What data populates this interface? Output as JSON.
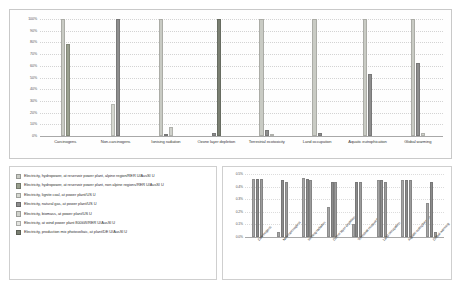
{
  "chart_data": [
    {
      "id": "main",
      "type": "bar",
      "title": "",
      "xlabel": "",
      "ylabel": "",
      "ylim": [
        0,
        100
      ],
      "ytick_labels": [
        "100%",
        "90%",
        "80%",
        "70%",
        "60%",
        "50%",
        "40%",
        "30%",
        "20%",
        "10%",
        "0%"
      ],
      "ytick_values": [
        100,
        90,
        80,
        70,
        60,
        50,
        40,
        30,
        20,
        10,
        0
      ],
      "grid": true,
      "legend_position": "below-left",
      "categories": [
        "Carcinogens",
        "Non-carcinogens",
        "Ionising radiation",
        "Ozone layer depletion",
        "Terrestrial ecotoxicity",
        "Land occupation",
        "Aquatic eutrophication",
        "Global warming"
      ],
      "series": [
        {
          "name": "Electricity, hydropower, at reservoir power plant, alpine region/RER U/AusSI U",
          "color": "#c9cbc4",
          "values": [
            100,
            0,
            100,
            0,
            100,
            100,
            100,
            100
          ]
        },
        {
          "name": "Electricity, hydropower, at reservoir power plant, non alpine regions/RER U/AusSI U",
          "color": "#9aa08f",
          "values": [
            79,
            0,
            0,
            0,
            0,
            0,
            0,
            0
          ]
        },
        {
          "name": "Electricity, lignite coal, at power plant/US U",
          "color": "#d5d7d0",
          "values": [
            0,
            27,
            0,
            0,
            0,
            0,
            0,
            0
          ]
        },
        {
          "name": "Electricity, natural gas, at power plant/US U",
          "color": "#8e8e8e",
          "values": [
            0,
            100,
            2,
            3,
            5,
            3,
            53,
            62
          ]
        },
        {
          "name": "Electricity, biomass, at power plant/US U",
          "color": "#cfd1cb",
          "values": [
            0,
            0,
            8,
            0,
            2,
            0,
            0,
            3
          ]
        },
        {
          "name": "Electricity, at wind power plant 800kW/RER U/AusSI U",
          "color": "#e2e3df",
          "values": [
            0,
            0,
            0,
            0,
            0,
            0,
            0,
            0
          ]
        },
        {
          "name": "Electricity, production mix photovoltaic, at plant/DE U/AusSI U",
          "color": "#7a7f72",
          "values": [
            0,
            0,
            0,
            100,
            0,
            0,
            0,
            0
          ]
        }
      ]
    },
    {
      "id": "inset",
      "type": "bar",
      "title": "",
      "xlabel": "",
      "ylabel": "",
      "ylim": [
        0,
        0.5
      ],
      "ytick_labels": [
        "0.5%",
        "0.4%",
        "0.3%",
        "0.2%",
        "0.1%",
        "0.0%"
      ],
      "ytick_values": [
        0.5,
        0.4,
        0.3,
        0.2,
        0.1,
        0.0
      ],
      "grid": true,
      "legend_position": "none",
      "categories": [
        "Carcinogens",
        "Non-carcinogens",
        "Ionising radiation",
        "Ozone layer depletion",
        "Terrestrial ecotoxicity",
        "Land occupation",
        "Aquatic eutrophication",
        "Global warming"
      ],
      "series": [
        {
          "name": "Electricity, at wind power plant 800kW/RER U/AusSI U",
          "color": "#a6a6a6",
          "values": [
            0.46,
            0.04,
            0.47,
            0.24,
            0.1,
            0.45,
            0.45,
            0.27
          ]
        },
        {
          "name": "Electricity, production mix photovoltaic, at plant/DE U/AusSI U",
          "color": "#8c8c8c",
          "values": [
            0.46,
            0.45,
            0.46,
            0.44,
            0.44,
            0.45,
            0.45,
            0.44
          ]
        },
        {
          "name": "Electricity, hydropower, at reservoir power plant, alpine region/RER U/AusSI U",
          "color": "#9c9c9c",
          "values": [
            0.46,
            0.44,
            0.45,
            0.44,
            0.44,
            0.44,
            0.45,
            0.04
          ]
        }
      ]
    }
  ],
  "main_chart": {
    "panel_name": "main-bar-chart"
  },
  "legend": {
    "items": [
      {
        "label": "Electricity, hydropower, at reservoir power plant, alpine region/RER U/AusSI U",
        "color": "#c9cbc4"
      },
      {
        "label": "Electricity, hydropower, at reservoir power plant, non alpine regions/RER U/AusSI U",
        "color": "#9aa08f"
      },
      {
        "label": "Electricity, lignite coal, at power plant/US U",
        "color": "#d5d7d0"
      },
      {
        "label": "Electricity, natural gas, at power plant/US U",
        "color": "#8e8e8e"
      },
      {
        "label": "Electricity, biomass, at power plant/US U",
        "color": "#cfd1cb"
      },
      {
        "label": "Electricity, at wind power plant 800kW/RER U/AusSI U",
        "color": "#e2e3df"
      },
      {
        "label": "Electricity, production mix photovoltaic, at plant/DE U/AusSI U",
        "color": "#7a7f72"
      }
    ]
  }
}
